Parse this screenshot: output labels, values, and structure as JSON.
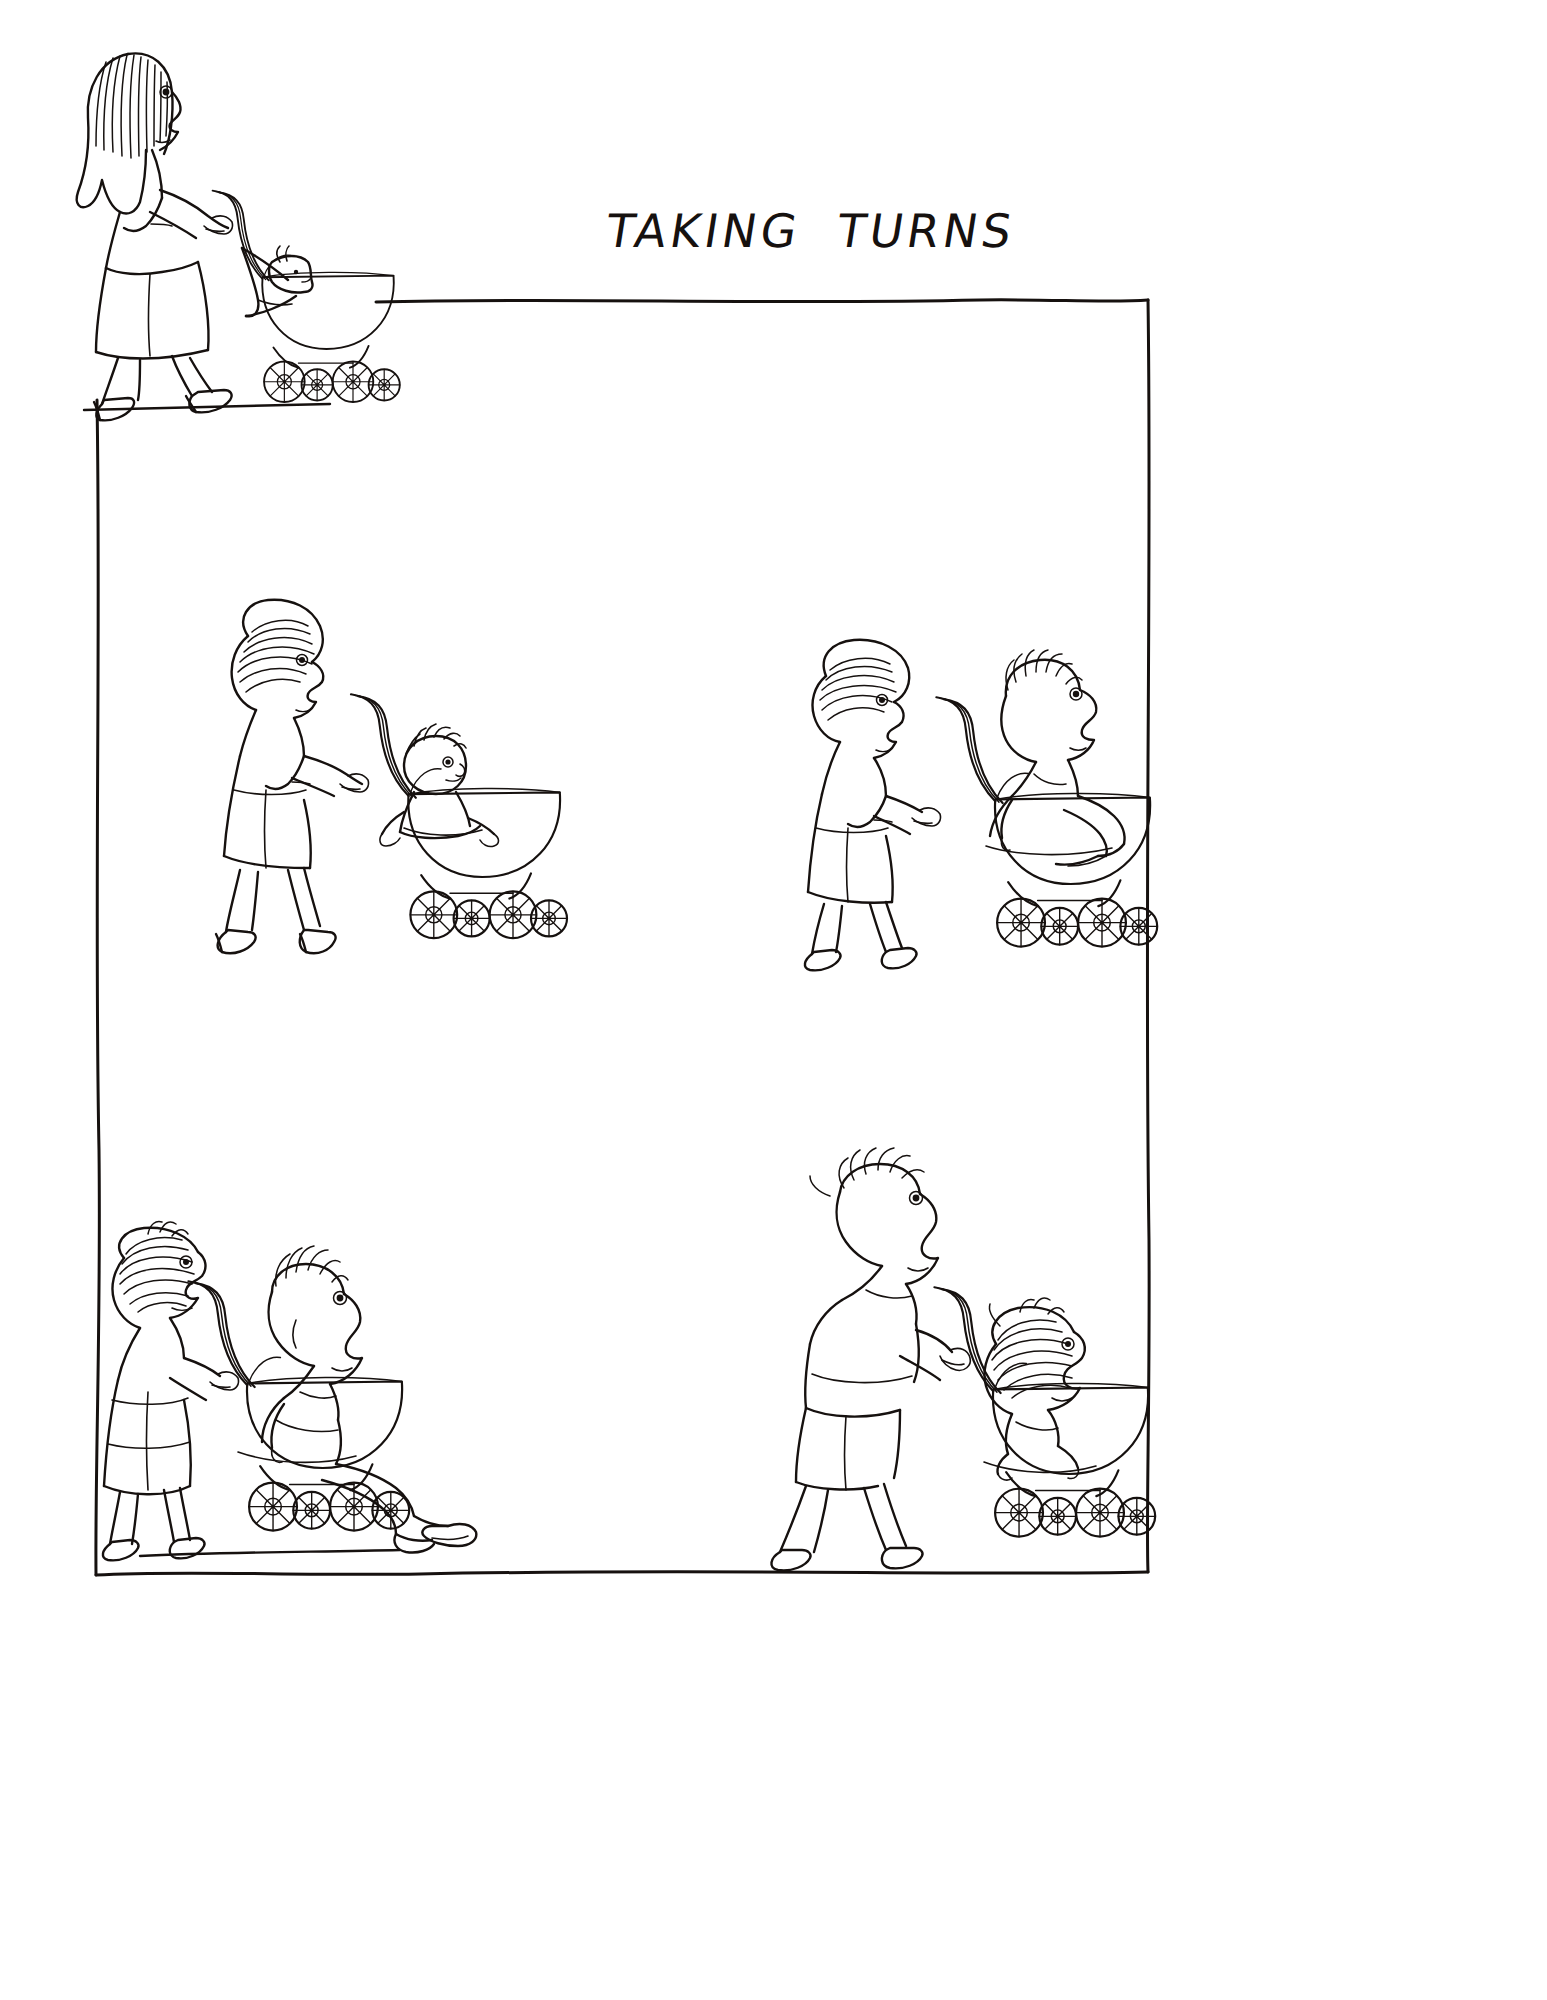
{
  "document": {
    "kind": "cartoon-illustration",
    "medium": "pen-and-ink line drawing",
    "background_color": "#ffffff",
    "ink_color": "#16110f",
    "width": 1547,
    "height": 2000
  },
  "title": {
    "text": "TAKING TURNS",
    "word_1": "TAKING",
    "word_2": "TURNS",
    "style": "hand-lettered capitals, slanted",
    "x": 690,
    "y": 172
  },
  "frame": {
    "description": "hand-drawn rectangular panel border, wobbly ink line, open at top-left",
    "top_y": 300,
    "left_x": 100,
    "right_x": 1150,
    "bottom_y": 1560,
    "stroke_color": "#16110f"
  },
  "panels": [
    {
      "id": "panel-1",
      "position": "top-left (outside frame, upper margin)",
      "caption": "",
      "figures": [
        {
          "role": "mother",
          "description": "young woman with long striped hair, sleeveless top and skirt, high-heeled shoes, walking left-to-right pushing a pram",
          "age_stage": "young adult"
        },
        {
          "role": "baby",
          "description": "infant lying in the pram, only head and blanket visible",
          "age_stage": "infant"
        }
      ],
      "props": [
        "pram",
        "curved pram handle",
        "four spoked wheels"
      ]
    },
    {
      "id": "panel-2",
      "position": "middle-left",
      "caption": "",
      "figures": [
        {
          "role": "mother",
          "description": "woman with tied-up striped hair, dress, heels, pushing pram",
          "age_stage": "adult"
        },
        {
          "role": "child",
          "description": "small child sitting upright inside the pram, arms on the rim",
          "age_stage": "toddler"
        }
      ],
      "props": [
        "pram",
        "curved pram handle",
        "four spoked wheels"
      ]
    },
    {
      "id": "panel-3",
      "position": "middle-right",
      "caption": "",
      "figures": [
        {
          "role": "mother",
          "description": "older woman with striped bun hair, dress, flat shoes, pushing pram",
          "age_stage": "middle-aged"
        },
        {
          "role": "son",
          "description": "grown young man with spiky hair crammed into the pram, knees drawn up",
          "age_stage": "young man"
        }
      ],
      "props": [
        "pram",
        "curved pram handle",
        "four spoked wheels"
      ]
    },
    {
      "id": "panel-4",
      "position": "bottom-left",
      "caption": "",
      "figures": [
        {
          "role": "mother",
          "description": "elderly stooped woman with wild hair, long dress, pushing pram with effort",
          "age_stage": "elderly"
        },
        {
          "role": "son",
          "description": "middle-aged balding man with long face slouched in the pram, legs dangling out",
          "age_stage": "middle-aged man"
        }
      ],
      "props": [
        "pram",
        "curved pram handle",
        "four spoked wheels"
      ]
    },
    {
      "id": "panel-5",
      "position": "bottom-right",
      "caption": "",
      "figures": [
        {
          "role": "son",
          "description": "old thin man with wispy hair, sleeveless shirt and shorts, now pushing the pram",
          "age_stage": "old man"
        },
        {
          "role": "mother",
          "description": "very old tiny woman with frizzy hair curled up inside the pram",
          "age_stage": "very elderly"
        }
      ],
      "props": [
        "pram",
        "curved pram handle",
        "four spoked wheels"
      ]
    }
  ],
  "narrative": {
    "summary": "A mother pushes her son in a pram through the stages of life; in the final scene the roles reverse and the aged son pushes his elderly mother."
  }
}
